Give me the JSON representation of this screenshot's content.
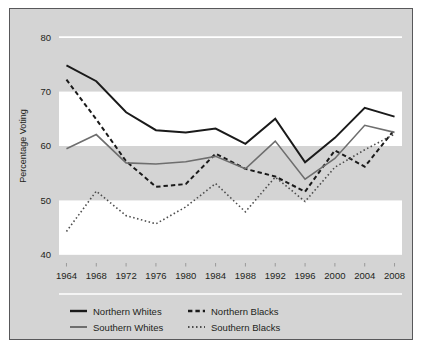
{
  "chart_data": {
    "type": "line",
    "title": "",
    "xlabel": "",
    "ylabel": "Percentage Voting",
    "x": [
      1964,
      1968,
      1972,
      1976,
      1980,
      1984,
      1988,
      1992,
      1996,
      2000,
      2004,
      2008
    ],
    "xticklabels": [
      "1964",
      "1968",
      "1972",
      "1976",
      "1980",
      "1984",
      "1988",
      "1992",
      "1996",
      "2000",
      "2004",
      "2008"
    ],
    "yticklabels": [
      "40",
      "50",
      "60",
      "70",
      "80"
    ],
    "yticks": [
      40,
      50,
      60,
      70,
      80
    ],
    "ylim": [
      38.5,
      81.5
    ],
    "xlim": [
      1963,
      2009
    ],
    "grid": "horizontal-banded",
    "legend_position": "below-axes",
    "series": [
      {
        "name": "Northern Whites",
        "style": "solid",
        "color": "#1a1a1a",
        "width": 2.0,
        "values": [
          74.8,
          71.9,
          66.2,
          62.9,
          62.5,
          63.2,
          60.4,
          65.0,
          57.0,
          61.5,
          67.0,
          65.4
        ]
      },
      {
        "name": "Northern Blacks",
        "style": "dashed",
        "color": "#1a1a1a",
        "width": 2.0,
        "values": [
          72.2,
          64.9,
          57.2,
          52.5,
          53.0,
          58.6,
          55.8,
          54.4,
          51.6,
          59.2,
          56.2,
          63.0
        ]
      },
      {
        "name": "Southern Whites",
        "style": "solid",
        "color": "#6e6e6e",
        "width": 1.6,
        "values": [
          59.5,
          62.1,
          56.9,
          56.7,
          57.1,
          58.1,
          55.8,
          60.9,
          53.9,
          57.7,
          63.8,
          62.5
        ]
      },
      {
        "name": "Southern Blacks",
        "style": "dotted",
        "color": "#4d4d4d",
        "width": 1.6,
        "values": [
          44.3,
          51.7,
          47.2,
          45.7,
          48.8,
          53.1,
          47.9,
          54.3,
          49.8,
          56.1,
          59.3,
          62.2
        ]
      }
    ]
  },
  "legend": {
    "items": [
      {
        "label": "Northern Whites",
        "swatch": "solid-black-line"
      },
      {
        "label": "Northern Blacks",
        "swatch": "dashed-black-line"
      },
      {
        "label": "Southern Whites",
        "swatch": "solid-gray-line"
      },
      {
        "label": "Southern Blacks",
        "swatch": "dotted-gray-line"
      }
    ]
  },
  "colors": {
    "panel_background": "#d4d4d4",
    "band_light": "#ffffff",
    "band_dark": "#d4d4d4",
    "frame": "#58585a",
    "text": "#231f20"
  }
}
